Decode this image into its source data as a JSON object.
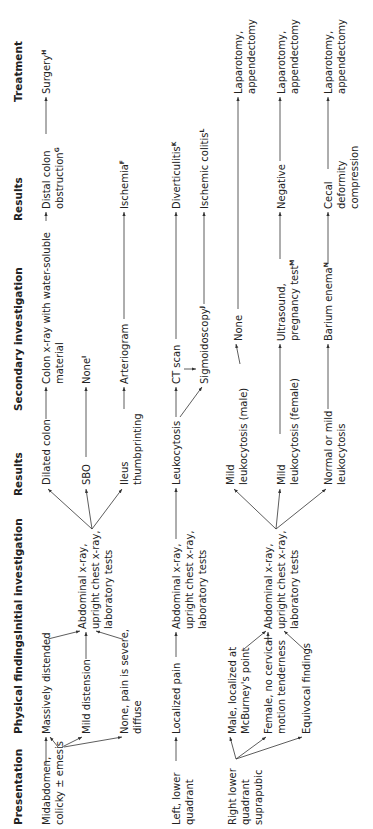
{
  "headers": {
    "presentation": "Presentation",
    "physical_findings": "Physical findings",
    "initial_investigation": "Initial investigation",
    "results1": "Results",
    "secondary_investigation": "Secondary investigation",
    "results2": "Results",
    "treatment": "Treatment"
  },
  "nodes": {
    "midabdomen": "Midabdomen,\ncolicky ± emesis",
    "massively_distended": "Massively distended",
    "mild_distension": "Mild distension",
    "none_pain_severe": "None, pain is severe,\ndiffuse",
    "init_inv_1": "Abdominal x-ray,\nupright chest x-ray,\nlaboratory tests",
    "dilated_colon": "Dilated colon",
    "sbo": "SBO",
    "ileus": "Ileus\nthumbprinting",
    "colon_xray": "Colon x-ray with water-soluble\nmaterial",
    "none_i": "None",
    "none_i_sup": "I",
    "arteriogram": "Arteriogram",
    "distal_colon": "Distal colon\nobstruction",
    "distal_colon_sup": "G",
    "ischemia": "Ischemia",
    "ischemia_sup": "F",
    "surgery": "Surgery",
    "surgery_sup": "H",
    "left_lower": "Left, lower\nquadrant",
    "localized_pain": "Localized pain",
    "init_inv_2": "Abdominal x-ray,\nupright chest x-ray,\nlaboratory tests",
    "leukocytosis": "Leukocytosis",
    "ct_scan": "CT scan",
    "sigmoidoscopy": "Sigmoidoscopy",
    "sigmoidoscopy_sup": "J",
    "diverticulitis": "Diverticulitis",
    "diverticulitis_sup": "K",
    "ischemic_colitis": "Ischemic colitis",
    "ischemic_colitis_sup": "L",
    "right_lower": "Right lower\nquadrant\nsuprapubic",
    "male_mcburney": "Male, localized at\nMcBurney's point",
    "female_no_cervical": "Female, no cervical\nmotion tenderness",
    "equivocal": "Equivocal findings",
    "init_inv_3": "Abdominal x-ray,\nupright chest x-ray,\nlaboratory tests",
    "mild_leuk_male": "Mild\nleukocytosis (male)",
    "mild_leuk_female": "Mild\nleukocytosis (female)",
    "normal_mild_leuk": "Normal or mild\nleukocytosis",
    "none_male": "None",
    "ultrasound": "Ultrasound,\npregnancy test",
    "ultrasound_sup": "M",
    "barium": "Barium enema",
    "barium_sup": "N",
    "negative": "Negative",
    "cecal": "Cecal\ndeformity\ncompression",
    "lap1": "Laparotomy,\nappendectomy",
    "lap2": "Laparotomy,\nappendectomy",
    "lap3": "Laparotomy,\nappendectomy"
  }
}
